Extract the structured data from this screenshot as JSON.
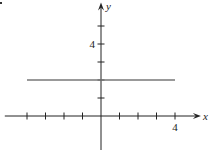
{
  "chart_data": {
    "type": "line",
    "title": "",
    "xlabel": "x",
    "ylabel": "y",
    "xlim": [
      -5.2,
      5.4
    ],
    "ylim": [
      -2.3,
      6.3
    ],
    "x_ticks": [
      -4,
      -3,
      -2,
      -1,
      1,
      2,
      3,
      4
    ],
    "y_ticks": [
      1,
      2,
      3,
      4,
      5
    ],
    "x_tick_labels": [
      {
        "value": 4,
        "text": "4"
      }
    ],
    "y_tick_labels": [
      {
        "value": 4,
        "text": "4"
      }
    ],
    "grid": false,
    "series": [
      {
        "name": "y = 2",
        "x": [
          -4,
          4
        ],
        "y": [
          2,
          2
        ],
        "color": "#777777"
      }
    ]
  }
}
